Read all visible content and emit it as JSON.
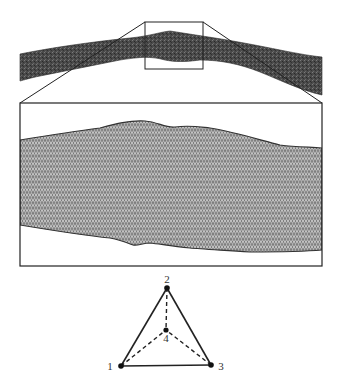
{
  "figure": {
    "overview": {
      "description": "Full vessel surface mesh (dark strip)",
      "fill_color": "#444444"
    },
    "zoom_box": {
      "description": "Region selected for magnification",
      "stroke_color": "#222222"
    },
    "inset": {
      "description": "Magnified triangulated surface mesh",
      "mesh_color": "#8a8a8a",
      "line_color": "#3a3a3a"
    },
    "tetrahedron": {
      "description": "Tetrahedral element with numbered vertices",
      "vertices": [
        {
          "id": "1",
          "label": "1"
        },
        {
          "id": "2",
          "label": "2"
        },
        {
          "id": "3",
          "label": "3"
        },
        {
          "id": "4",
          "label": "4"
        }
      ],
      "solid_edges": [
        "1-2",
        "2-3",
        "1-3"
      ],
      "dashed_edges": [
        "1-4",
        "2-4",
        "3-4"
      ]
    }
  }
}
